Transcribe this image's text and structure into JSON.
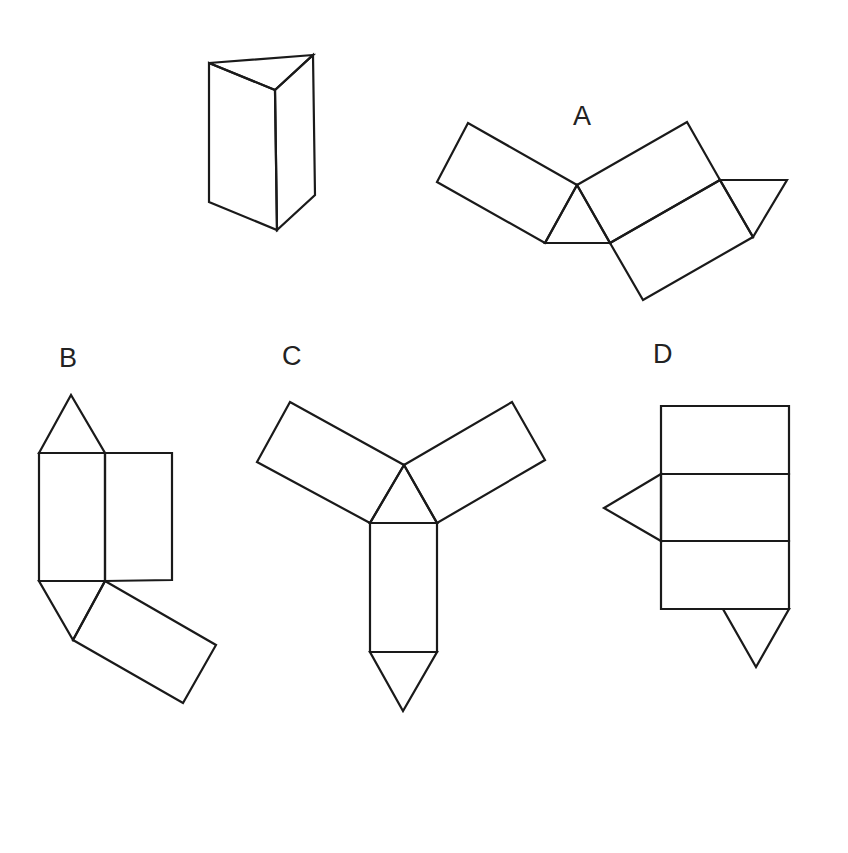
{
  "colors": {
    "stroke": "#1a1a1a",
    "background": "#ffffff",
    "text": "#222222"
  },
  "figures": {
    "prism": {
      "label": "",
      "description": "Triangular prism (3D view)"
    },
    "option_a": {
      "label": "A"
    },
    "option_b": {
      "label": "B"
    },
    "option_c": {
      "label": "C"
    },
    "option_d": {
      "label": "D"
    }
  }
}
